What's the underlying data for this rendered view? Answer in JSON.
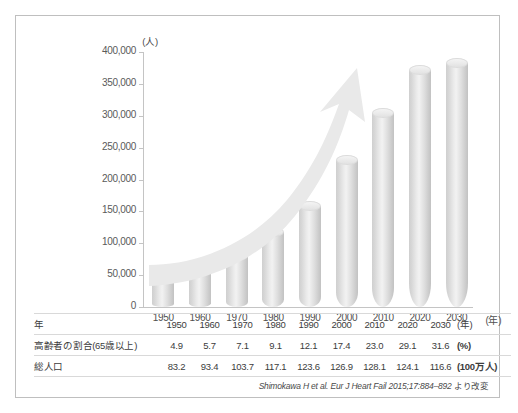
{
  "chart_data": {
    "type": "bar",
    "title": "",
    "subtitle": "",
    "xlabel": "年",
    "ylabel": "(人)",
    "y_unit_label": "(人)",
    "x_unit_label": "(年)",
    "categories": [
      "1950",
      "1960",
      "1970",
      "1980",
      "1990",
      "2000",
      "2010",
      "2020",
      "2030"
    ],
    "values": [
      48000,
      60000,
      80000,
      117000,
      158000,
      230000,
      305000,
      372000,
      382000
    ],
    "ylim": [
      0,
      400000
    ],
    "yticks": [
      "0",
      "50,000",
      "100,000",
      "150,000",
      "200,000",
      "250,000",
      "300,000",
      "350,000",
      "400,000"
    ],
    "ytick_values": [
      0,
      50000,
      100000,
      150000,
      200000,
      250000,
      300000,
      350000,
      400000
    ],
    "grid": false,
    "legend": "none",
    "annotations": [
      {
        "name": "upward-trend-arrow",
        "description": "curved rising arrow overlay"
      }
    ],
    "series": [
      {
        "name": "患者数",
        "values": [
          48000,
          60000,
          80000,
          117000,
          158000,
          230000,
          305000,
          372000,
          382000
        ]
      }
    ],
    "bar_color": "#dcdcdc",
    "arrow_color": "#e8e8e8"
  },
  "table": {
    "rows": [
      {
        "label": "年",
        "values": [
          "1950",
          "1960",
          "1970",
          "1980",
          "1990",
          "2000",
          "2010",
          "2020",
          "2030"
        ],
        "unit": "(年)"
      },
      {
        "label": "高齢者の割合(65歳以上)",
        "values": [
          "4.9",
          "5.7",
          "7.1",
          "9.1",
          "12.1",
          "17.4",
          "23.0",
          "29.1",
          "31.6"
        ],
        "unit": "(%)"
      },
      {
        "label": "総人口",
        "values": [
          "83.2",
          "93.4",
          "103.7",
          "117.1",
          "123.6",
          "126.9",
          "128.1",
          "124.1",
          "116.6"
        ],
        "unit": "(100万人)"
      }
    ]
  },
  "citation": {
    "reference": "Shimokawa H et al. Eur J Heart Fail 2015;17:884–892",
    "suffix": " より改変"
  },
  "colors": {
    "border": "#bfbfbf",
    "axis": "#c4c4c4",
    "bar": "#dcdcdc",
    "arrow": "#e8e8e8",
    "text": "#3a3a3a"
  }
}
